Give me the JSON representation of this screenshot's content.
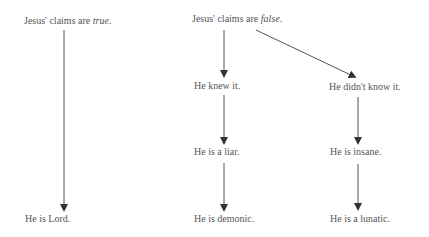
{
  "diagram": {
    "nodes": {
      "true_claim": {
        "prefix": "Jesus' claims are ",
        "emph": "true",
        "suffix": "."
      },
      "false_claim": {
        "prefix": "Jesus' claims are ",
        "emph": "false",
        "suffix": "."
      },
      "knew": {
        "label": "He knew it."
      },
      "didnt_know": {
        "label": "He didn't know it."
      },
      "liar": {
        "label": "He is a liar."
      },
      "insane": {
        "label": "He is insane."
      },
      "lord": {
        "label": "He is Lord."
      },
      "demonic": {
        "label": "He is demonic."
      },
      "lunatic": {
        "label": "He is a lunatic."
      }
    },
    "edges": [
      {
        "from": "true_claim",
        "to": "lord"
      },
      {
        "from": "false_claim",
        "to": "knew"
      },
      {
        "from": "false_claim",
        "to": "didnt_know"
      },
      {
        "from": "knew",
        "to": "liar"
      },
      {
        "from": "liar",
        "to": "demonic"
      },
      {
        "from": "didnt_know",
        "to": "insane"
      },
      {
        "from": "insane",
        "to": "lunatic"
      }
    ],
    "line_color": "#444444",
    "text_color": "#555555"
  }
}
